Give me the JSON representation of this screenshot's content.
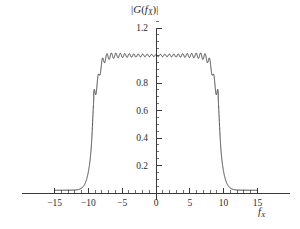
{
  "chart_data": {
    "type": "line",
    "title_plain": "|G(fX)|",
    "xlabel": "f_X",
    "xlabel_plain": "fX",
    "ylabel": "",
    "xlim": [
      -15.6,
      15.6
    ],
    "ylim": [
      0,
      1.27
    ],
    "xticks": [
      -15,
      -10,
      -5,
      0,
      5,
      10,
      15
    ],
    "xtick_labels": [
      "-15",
      "-10",
      "-5",
      "0",
      "5",
      "10",
      "15"
    ],
    "yticks": [
      0.2,
      0.4,
      0.6,
      0.8,
      1.2
    ],
    "ytick_labels": [
      "0.2",
      "0.4",
      "0.6",
      "0.8",
      "1.2"
    ],
    "ytick_minor_step": 0.05,
    "xtick_minor_step": 1,
    "grid": false,
    "legend": null,
    "line_color": "#2a2a2a",
    "background_color": "#ffffff",
    "axis_color": "#3a3a3a",
    "series": [
      {
        "name": "|G(fX)|",
        "passband_level": 1.0,
        "peak_value": 1.18,
        "peak_positions": [
          -9.2,
          9.2
        ],
        "ripple_band": [
          0.93,
          1.06
        ],
        "tail_value": 0.02,
        "cutoff": 9.2,
        "transition_width": 2.8,
        "ripple_frequency": 9.5
      }
    ]
  },
  "figure": {
    "axis_labels": {
      "x_title_glyph_main": "f",
      "x_title_glyph_sub": "X",
      "title_open": "|",
      "title_G": "G",
      "title_paren_open": "(",
      "title_f": "f",
      "title_sub": "X",
      "title_paren_close": ")",
      "title_close": "|"
    }
  }
}
